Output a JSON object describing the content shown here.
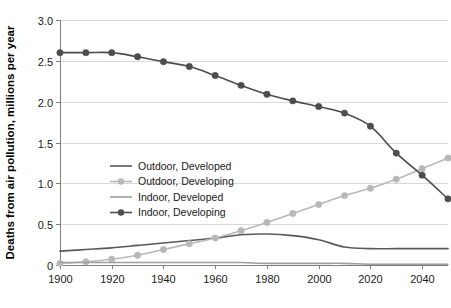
{
  "chart_data": {
    "type": "line",
    "title": "",
    "xlabel": "",
    "ylabel": "Deaths from air pollution, millions per year",
    "xlim": [
      1900,
      2050
    ],
    "ylim": [
      0,
      3.0
    ],
    "xticks": [
      1900,
      1920,
      1940,
      1960,
      1980,
      2000,
      2020,
      2040
    ],
    "xtick_labels": [
      "1900",
      "1920",
      "1940",
      "1960",
      "1980",
      "2000",
      "2020",
      "2040"
    ],
    "yticks": [
      0,
      0.5,
      1.0,
      1.5,
      2.0,
      2.5,
      3.0
    ],
    "ytick_labels": [
      "0",
      "0.5",
      "1.0",
      "1.5",
      "2.0",
      "2.5",
      "3.0"
    ],
    "grid": true,
    "legend_position": "center-left",
    "x": [
      1900,
      1910,
      1920,
      1930,
      1940,
      1950,
      1960,
      1970,
      1980,
      1990,
      2000,
      2010,
      2020,
      2030,
      2040,
      2050
    ],
    "series": [
      {
        "name": "Outdoor, Developed",
        "color": "#595959",
        "marker": "none",
        "values": [
          0.17,
          0.19,
          0.21,
          0.24,
          0.27,
          0.3,
          0.33,
          0.37,
          0.38,
          0.36,
          0.31,
          0.22,
          0.2,
          0.2,
          0.2,
          0.2
        ]
      },
      {
        "name": "Outdoor, Developing",
        "color": "#b8b8b8",
        "marker": "circle",
        "values": [
          0.02,
          0.04,
          0.07,
          0.12,
          0.19,
          0.26,
          0.33,
          0.42,
          0.52,
          0.63,
          0.74,
          0.85,
          0.94,
          1.05,
          1.18,
          1.31
        ]
      },
      {
        "name": "Indoor, Developed",
        "color": "#9e9e9e",
        "marker": "none",
        "values": [
          0.03,
          0.03,
          0.03,
          0.03,
          0.03,
          0.03,
          0.03,
          0.03,
          0.02,
          0.02,
          0.02,
          0.02,
          0.01,
          0.01,
          0.01,
          0.01
        ]
      },
      {
        "name": "Indoor, Developing",
        "color": "#4d4d4d",
        "marker": "circle",
        "values": [
          2.6,
          2.6,
          2.6,
          2.55,
          2.49,
          2.43,
          2.32,
          2.2,
          2.09,
          2.01,
          1.94,
          1.86,
          1.7,
          1.37,
          1.1,
          0.81
        ]
      }
    ]
  },
  "legend": {
    "items": [
      {
        "label": "Outdoor, Developed"
      },
      {
        "label": "Outdoor, Developing"
      },
      {
        "label": "Indoor, Developed"
      },
      {
        "label": "Indoor, Developing"
      }
    ]
  }
}
